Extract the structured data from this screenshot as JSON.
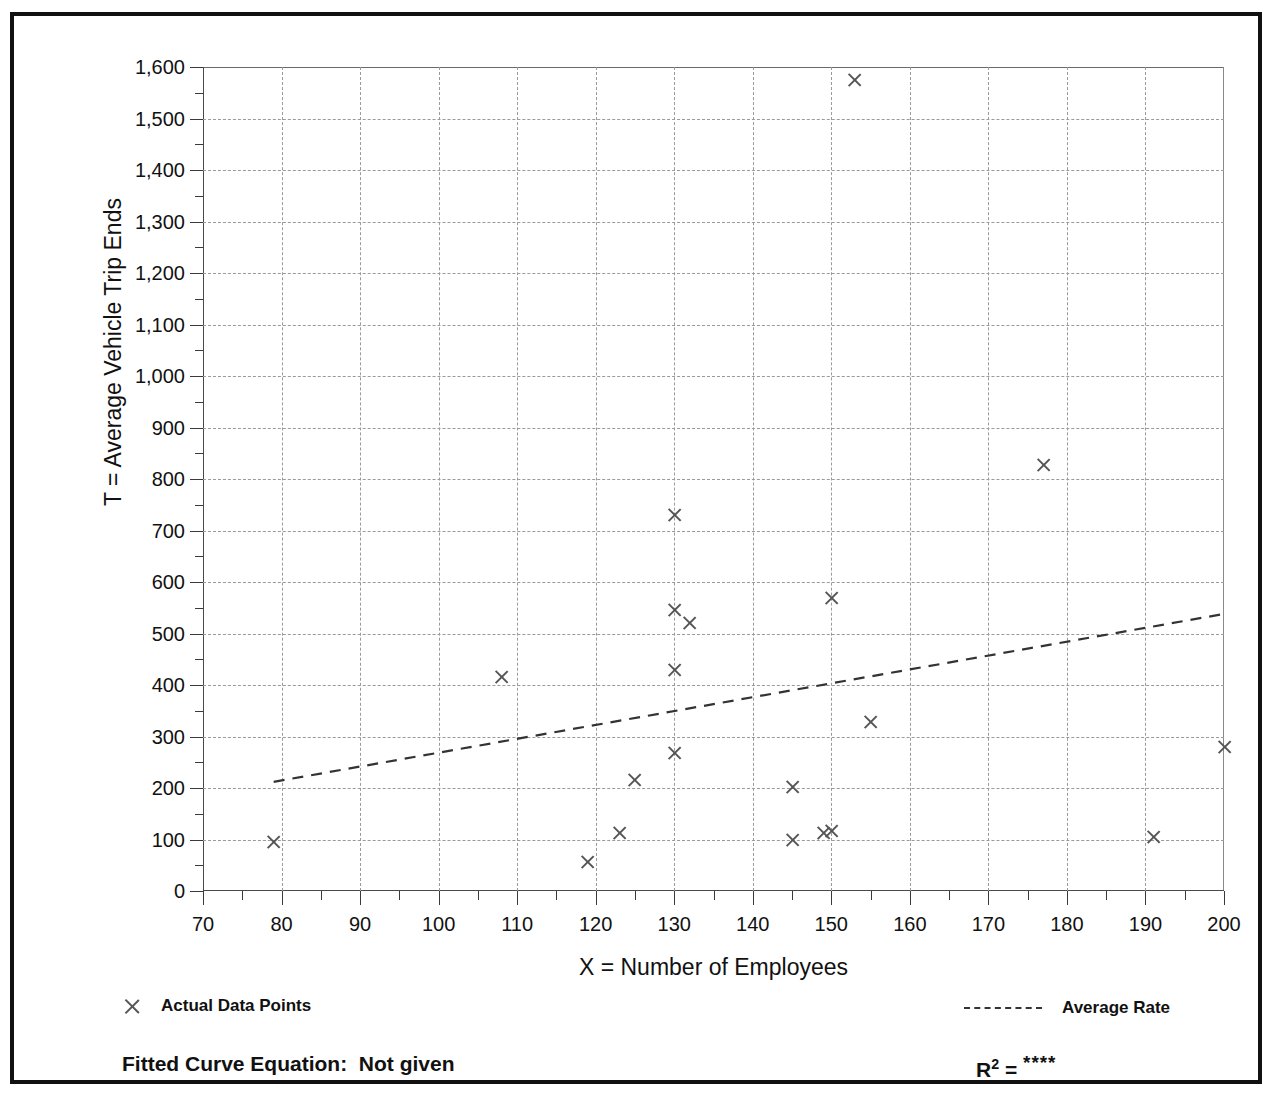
{
  "chart_data": {
    "type": "scatter",
    "title": "",
    "xlabel": "X = Number of Employees",
    "ylabel": "T = Average Vehicle Trip Ends",
    "xlim": [
      70,
      200
    ],
    "ylim": [
      0,
      1600
    ],
    "x_ticks": [
      70,
      80,
      90,
      100,
      110,
      120,
      130,
      140,
      150,
      160,
      170,
      180,
      190,
      200
    ],
    "x_tick_labels": [
      "70",
      "80",
      "90",
      "100",
      "110",
      "120",
      "130",
      "140",
      "150",
      "160",
      "170",
      "180",
      "190",
      "200"
    ],
    "x_minor_step": 5,
    "y_ticks": [
      0,
      100,
      200,
      300,
      400,
      500,
      600,
      700,
      800,
      900,
      1000,
      1100,
      1200,
      1300,
      1400,
      1500,
      1600
    ],
    "y_tick_labels": [
      "0",
      "100",
      "200",
      "300",
      "400",
      "500",
      "600",
      "700",
      "800",
      "900",
      "1,000",
      "1,100",
      "1,200",
      "1,300",
      "1,400",
      "1,500",
      "1,600"
    ],
    "y_minor_step": 50,
    "grid": true,
    "legend_position": "below-axes",
    "series": [
      {
        "name": "Actual Data Points",
        "type": "scatter",
        "marker": "x",
        "color": "#555555",
        "points": [
          {
            "x": 79,
            "y": 95
          },
          {
            "x": 108,
            "y": 415
          },
          {
            "x": 119,
            "y": 57
          },
          {
            "x": 123,
            "y": 113
          },
          {
            "x": 125,
            "y": 215
          },
          {
            "x": 130,
            "y": 730
          },
          {
            "x": 130,
            "y": 545
          },
          {
            "x": 130,
            "y": 430
          },
          {
            "x": 130,
            "y": 267
          },
          {
            "x": 132,
            "y": 520
          },
          {
            "x": 145,
            "y": 202
          },
          {
            "x": 145,
            "y": 100
          },
          {
            "x": 149,
            "y": 113
          },
          {
            "x": 150,
            "y": 117
          },
          {
            "x": 150,
            "y": 568
          },
          {
            "x": 153,
            "y": 1575
          },
          {
            "x": 155,
            "y": 328
          },
          {
            "x": 177,
            "y": 828
          },
          {
            "x": 191,
            "y": 105
          },
          {
            "x": 200,
            "y": 280
          }
        ]
      },
      {
        "name": "Average Rate",
        "type": "line",
        "style": "dashed",
        "color": "#333333",
        "endpoints": [
          {
            "x": 79,
            "y": 212
          },
          {
            "x": 200,
            "y": 538
          }
        ]
      }
    ]
  },
  "legend": {
    "items": [
      {
        "marker": "x-marker",
        "label": "Actual Data Points"
      },
      {
        "marker": "dashed-line",
        "label": "Average Rate"
      }
    ]
  },
  "footer": {
    "fitted_curve_label": "Fitted Curve Equation:  Not given",
    "r2_label": "R",
    "r2_exponent": "2",
    "r2_equals": " = ",
    "r2_value": "****"
  }
}
